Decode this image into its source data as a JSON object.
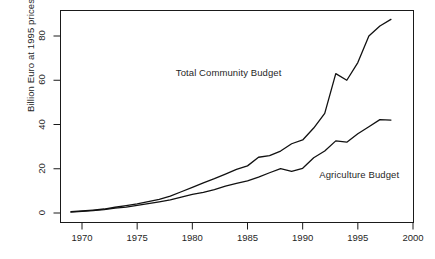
{
  "chart_data": {
    "type": "line",
    "title": "",
    "xlabel": "",
    "ylabel": "Billion Euro at 1995 prices",
    "xlim": [
      1968,
      2000.5
    ],
    "ylim": [
      -1,
      90
    ],
    "xticks": [
      1970,
      1975,
      1980,
      1985,
      1990,
      1995,
      2000
    ],
    "xtick_labels": [
      "1970",
      "1975",
      "1980",
      "1985",
      "1990",
      "1995",
      "2000"
    ],
    "yticks": [
      0,
      20,
      40,
      60,
      80
    ],
    "ytick_labels": [
      "0",
      "20",
      "40",
      "60",
      "80"
    ],
    "grid": false,
    "legend_position": "inline-annotations",
    "line_color": "#111111",
    "background_color": "#ffffff",
    "x": [
      1969,
      1970,
      1971,
      1972,
      1973,
      1974,
      1975,
      1976,
      1977,
      1978,
      1979,
      1980,
      1981,
      1982,
      1983,
      1984,
      1985,
      1986,
      1987,
      1988,
      1989,
      1990,
      1991,
      1992,
      1993,
      1994,
      1995,
      1996,
      1997,
      1998
    ],
    "series": [
      {
        "name": "Total Community Budget",
        "label": "Total Community Budget",
        "label_x": 1978.5,
        "label_y": 63.5,
        "values": [
          0.6,
          0.9,
          1.3,
          1.8,
          2.6,
          3.3,
          4.1,
          5.1,
          6.2,
          7.6,
          9.6,
          11.6,
          13.6,
          15.5,
          17.6,
          19.7,
          21.3,
          25.2,
          25.9,
          28.0,
          31.3,
          33.0,
          38.4,
          45.0,
          50.0,
          48.0,
          54.5,
          64.0,
          71.0,
          75.0
        ],
        "values_plot": [
          0.6,
          0.9,
          1.3,
          1.8,
          2.6,
          3.3,
          4.1,
          5.1,
          6.2,
          7.6,
          9.6,
          11.6,
          13.6,
          15.5,
          17.6,
          19.7,
          21.3,
          25.2,
          25.9,
          28.0,
          31.3,
          33.0,
          38.4,
          45.0,
          63.0,
          60.0,
          68.0,
          80.0,
          84.5,
          87.5
        ]
      },
      {
        "name": "Agriculture Budget",
        "label": "Agriculture Budget",
        "label_x": 1991.5,
        "label_y": 17.0,
        "values": [
          0.4,
          0.7,
          1.1,
          1.5,
          2.2,
          2.7,
          3.4,
          4.2,
          5.0,
          5.9,
          7.2,
          8.4,
          9.3,
          10.6,
          12.2,
          13.4,
          14.5,
          16.2,
          18.2,
          20.1,
          18.8,
          20.2,
          25.0,
          28.0,
          32.6,
          32.0,
          35.8,
          39.0,
          42.2,
          42.0
        ]
      }
    ],
    "annotations": [
      {
        "text": "Total Community Budget",
        "x": 1978.5,
        "y": 63.5
      },
      {
        "text": "Agriculture Budget",
        "x": 1991.5,
        "y": 17.0
      }
    ]
  }
}
